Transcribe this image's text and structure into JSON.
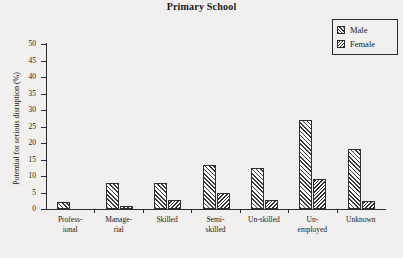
{
  "chart_data": {
    "type": "bar",
    "title": "Primary School",
    "xlabel": "",
    "ylabel": "Potential for serious disruption (%)",
    "ylim": [
      0,
      50
    ],
    "yticks": [
      0,
      5,
      10,
      15,
      20,
      25,
      30,
      35,
      40,
      45,
      50
    ],
    "ytick_labels": [
      "0",
      "5",
      "10",
      "15",
      "20",
      "25",
      "30",
      "35",
      "40",
      "45",
      "50"
    ],
    "grid": false,
    "legend_position": "top-right",
    "categories": [
      "Profess-\nional",
      "Manage-\nrial",
      "Skilled",
      "Semi-\nskilled",
      "Un-skilled",
      "Un-\nemployed",
      "Unknown"
    ],
    "category_lines": [
      [
        "Profess-",
        "ional"
      ],
      [
        "Manage-",
        "rial"
      ],
      [
        "Skilled",
        ""
      ],
      [
        "Semi-",
        "skilled"
      ],
      [
        "Un-skilled",
        ""
      ],
      [
        "Un-",
        "employed"
      ],
      [
        "Unknown",
        ""
      ]
    ],
    "series": [
      {
        "name": "Male",
        "pattern": "forward-diagonal-hatch",
        "values": [
          2.1,
          8.0,
          8.0,
          13.3,
          12.4,
          27.1,
          18.3
        ]
      },
      {
        "name": "Female",
        "pattern": "backward-diagonal-hatch",
        "values": [
          0.0,
          1.0,
          2.8,
          5.0,
          2.8,
          9.2,
          2.4
        ]
      }
    ]
  },
  "legend": {
    "items": [
      {
        "label": "Male"
      },
      {
        "label": "Female"
      }
    ]
  },
  "colors": {
    "background": "#f1f0ee",
    "axis": "#2b2b2b",
    "hatch": "#3a3a3a",
    "bar_fill": "#ffffff"
  }
}
